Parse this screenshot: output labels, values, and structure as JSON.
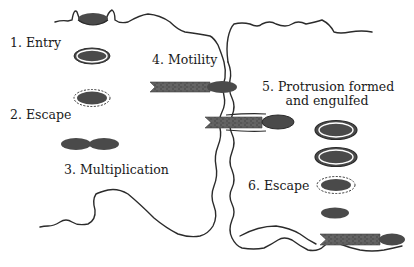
{
  "diagram": {
    "type": "bacterial cell-to-cell spread life cycle",
    "colors": {
      "background": "#ffffff",
      "membrane": "#2b2b2b",
      "bacterium": "#4a4a4a",
      "actin_tail": "#555555",
      "vacuole": "#2b2b2b"
    },
    "steps": [
      {
        "number": "1",
        "label": "1. Entry"
      },
      {
        "number": "2",
        "label": "2. Escape"
      },
      {
        "number": "3",
        "label": "3. Multiplication"
      },
      {
        "number": "4",
        "label": "4. Motility"
      },
      {
        "number": "5",
        "label_line1": "5. Protrusion formed",
        "label_line2": "and engulfed"
      },
      {
        "number": "6",
        "label": "6. Escape"
      }
    ],
    "cells": [
      {
        "name": "infected cell (left)"
      },
      {
        "name": "neighboring cell (right)"
      }
    ]
  }
}
